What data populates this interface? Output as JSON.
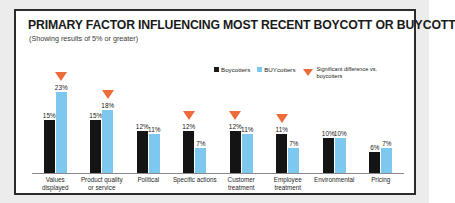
{
  "title_main": "PRIMARY FACTOR INFLUENCING MOST RECENT BOYCOTT OR ",
  "title_emphasis": "BUY",
  "title_tail": "COTT",
  "subtitle": "(Showing results of 5% or greater)",
  "legend": {
    "boycotters": "Boycotters",
    "buycotters": "BUYcotters",
    "significance_note": "Significant difference vs. boycotters"
  },
  "colors": {
    "boycotters": "#141414",
    "buycotters": "#7dc8ee",
    "marker": "#ee6b3b",
    "frame": "#2b2b2b",
    "page_background": "#ececed"
  },
  "chart_data": {
    "type": "bar",
    "title": "PRIMARY FACTOR INFLUENCING MOST RECENT BOYCOTT OR BUYCOTT",
    "subtitle": "(Showing results of 5% or greater)",
    "xlabel": "",
    "ylabel": "",
    "ylim": [
      0,
      25
    ],
    "grid": false,
    "legend_position": "top-right",
    "categories": [
      "Values displayed",
      "Product quality or service",
      "Political",
      "Specific actions",
      "Customer treatment",
      "Employee treatment",
      "Environmental",
      "Pricing"
    ],
    "category_lines": [
      [
        "Values",
        "displayed"
      ],
      [
        "Product quality",
        "or service"
      ],
      [
        "Political"
      ],
      [
        "Specific actions"
      ],
      [
        "Customer",
        "treatment"
      ],
      [
        "Employee",
        "treatment"
      ],
      [
        "Environmental"
      ],
      [
        "Pricing"
      ]
    ],
    "series": [
      {
        "name": "Boycotters",
        "color": "#141414",
        "values": [
          15,
          15,
          12,
          12,
          12,
          11,
          10,
          6
        ],
        "labels": [
          "15%",
          "15%",
          "12%",
          "12%",
          "12%",
          "11%",
          "10%",
          "6%"
        ]
      },
      {
        "name": "BUYcotters",
        "color": "#7dc8ee",
        "values": [
          23,
          18,
          11,
          7,
          11,
          7,
          10,
          7
        ],
        "labels": [
          "23%",
          "18%",
          "11%",
          "7%",
          "11%",
          "7%",
          "10%",
          "7%"
        ]
      }
    ],
    "significance_markers": [
      {
        "category": "Values displayed",
        "series": "BUYcotters",
        "marked": true
      },
      {
        "category": "Product quality or service",
        "series": "BUYcotters",
        "marked": true
      },
      {
        "category": "Political",
        "series": "none",
        "marked": false
      },
      {
        "category": "Specific actions",
        "series": "Boycotters",
        "marked": true
      },
      {
        "category": "Customer treatment",
        "series": "Boycotters",
        "marked": true
      },
      {
        "category": "Employee treatment",
        "series": "Boycotters",
        "marked": true
      },
      {
        "category": "Environmental",
        "series": "none",
        "marked": false
      },
      {
        "category": "Pricing",
        "series": "none",
        "marked": false
      }
    ]
  }
}
